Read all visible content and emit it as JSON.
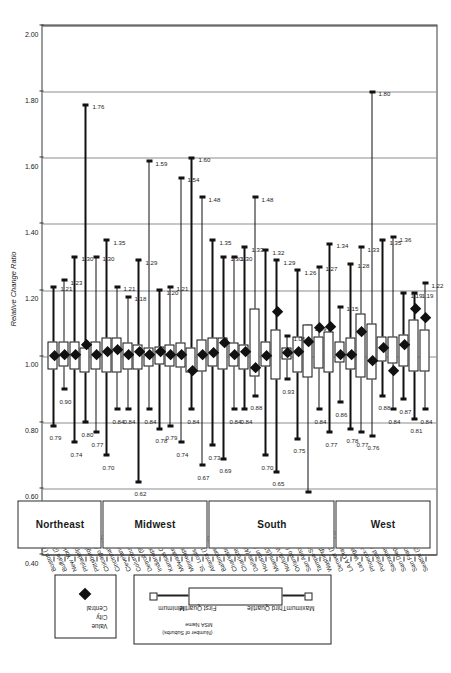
{
  "chart_data": {
    "type": "box",
    "title": "",
    "xlabel": "",
    "ylabel": "Relative Change Ratio",
    "ylim": [
      0.4,
      2.0
    ],
    "ytick_labels": [
      "2.00",
      "1.80",
      "1.60",
      "1.40",
      "1.20",
      "1.00",
      "0.80",
      "0.60",
      "0.40"
    ],
    "ytick_values": [
      2.0,
      1.8,
      1.6,
      1.4,
      1.2,
      1.0,
      0.8,
      0.6,
      0.4
    ],
    "grid": "vertical-at-ticks",
    "orientation": "horizontal-boxes-rotated-page",
    "regions": [
      {
        "name": "West",
        "start_index": 0,
        "end_index": 8
      },
      {
        "name": "South",
        "start_index": 9,
        "end_index": 20
      },
      {
        "name": "Midwest",
        "start_index": 21,
        "end_index": 30
      },
      {
        "name": "Northeast",
        "start_index": 31,
        "end_index": 38
      }
    ],
    "categories": [
      {
        "label": "Seattle (36)",
        "min": 0.84,
        "q1": 0.96,
        "q3": 1.08,
        "max": 1.22,
        "central": 1.115
      },
      {
        "label": "San Francisco (73)",
        "min": 0.81,
        "q1": 0.96,
        "q3": 1.11,
        "max": 1.19,
        "central": 1.145
      },
      {
        "label": "San Diego (34)",
        "min": 0.87,
        "q1": 0.975,
        "q3": 1.065,
        "max": 1.19,
        "central": 1.035
      },
      {
        "label": "Sacramento-Yolo (29)",
        "min": 0.84,
        "q1": 0.985,
        "q3": 1.06,
        "max": 1.36,
        "central": 0.955
      },
      {
        "label": "Portland (32)",
        "min": 0.88,
        "q1": 0.99,
        "q3": 1.06,
        "max": 1.35,
        "central": 1.025
      },
      {
        "label": "Phoenix-Mesa (38)",
        "min": 0.76,
        "q1": 0.935,
        "q3": 1.1,
        "max": 1.8,
        "central": 0.985
      },
      {
        "label": "Las Vegas (9)",
        "min": 0.77,
        "q1": 0.94,
        "q3": 1.13,
        "max": 1.33,
        "central": 1.075
      },
      {
        "label": "LA A Orange Co x (138)",
        "min": 0.78,
        "q1": 0.965,
        "q3": 1.055,
        "max": 1.28,
        "central": 1.005
      },
      {
        "label": "Denver (28)",
        "min": 0.86,
        "q1": 0.985,
        "q3": 1.045,
        "max": 1.15,
        "central": 1.005
      },
      {
        "label": "Washington, D.C. (136)",
        "min": 0.77,
        "q1": 0.955,
        "q3": 1.075,
        "max": 1.34,
        "central": 1.09
      },
      {
        "label": "Tampa-St. Petersburg (41)",
        "min": 0.84,
        "q1": 0.97,
        "q3": 1.06,
        "max": 1.27,
        "central": 1.085
      },
      {
        "label": "San Antonio (15)",
        "min": 0.59,
        "q1": 0.94,
        "q3": 1.095,
        "max": 1.09,
        "central": 1.045
      },
      {
        "label": "Orlando (22)",
        "min": 0.75,
        "q1": 0.955,
        "q3": 1.06,
        "max": 1.26,
        "central": 1.015
      },
      {
        "label": "Norfolk-Va Beach (19)",
        "min": 0.93,
        "q1": 0.995,
        "q3": 1.025,
        "max": 1.06,
        "central": 1.01
      },
      {
        "label": "Miami (52)",
        "min": 0.65,
        "q1": 0.935,
        "q3": 1.08,
        "max": 1.29,
        "central": 1.135
      },
      {
        "label": "Houston (43)",
        "min": 0.7,
        "q1": 0.975,
        "q3": 1.045,
        "max": 1.32,
        "central": 1.0
      },
      {
        "label": "Dallas (48)",
        "min": 0.88,
        "q1": 0.945,
        "q3": 1.145,
        "max": 1.48,
        "central": 0.965
      },
      {
        "label": "Charlotte NC (34)",
        "min": 0.84,
        "q1": 0.965,
        "q3": 1.035,
        "max": 1.33,
        "central": 1.015
      },
      {
        "label": "Charleston (28)",
        "min": 0.84,
        "q1": 0.975,
        "q3": 1.04,
        "max": 1.3,
        "central": 1.005
      },
      {
        "label": "Baltimore (88)",
        "min": 0.69,
        "q1": 0.965,
        "q3": 1.055,
        "max": 1.3,
        "central": 1.04
      },
      {
        "label": "Atlanta (106)",
        "min": 0.73,
        "q1": 0.975,
        "q3": 1.055,
        "max": 1.35,
        "central": 1.01
      },
      {
        "label": "St. Louis (98)",
        "min": 0.67,
        "q1": 0.96,
        "q3": 1.05,
        "max": 1.48,
        "central": 1.005
      },
      {
        "label": "Minneapolis-St. Paul (36)",
        "min": 0.84,
        "q1": 0.955,
        "q3": 1.025,
        "max": 1.6,
        "central": 0.955
      },
      {
        "label": "Milwaukee (40)",
        "min": 0.74,
        "q1": 0.97,
        "q3": 1.04,
        "max": 1.54,
        "central": 1.005
      },
      {
        "label": "Kansas City (26)",
        "min": 0.79,
        "q1": 0.975,
        "q3": 1.035,
        "max": 1.21,
        "central": 1.005
      },
      {
        "label": "Indianapolis (88)",
        "min": 0.78,
        "q1": 0.98,
        "q3": 1.03,
        "max": 1.2,
        "central": 1.015
      },
      {
        "label": "Detroit (99)",
        "min": 0.84,
        "q1": 0.975,
        "q3": 1.025,
        "max": 1.59,
        "central": 1.005
      },
      {
        "label": "Columbus OH (28)",
        "min": 0.62,
        "q1": 0.965,
        "q3": 1.035,
        "max": 1.29,
        "central": 1.015
      },
      {
        "label": "Cleveland (76)",
        "min": 0.84,
        "q1": 0.965,
        "q3": 1.04,
        "max": 1.18,
        "central": 1.005
      },
      {
        "label": "Cincinnati (67)",
        "min": 0.84,
        "q1": 0.955,
        "q3": 1.055,
        "max": 1.21,
        "central": 1.02
      },
      {
        "label": "Chicago (213)",
        "min": 0.7,
        "q1": 0.955,
        "q3": 1.055,
        "max": 1.35,
        "central": 1.015
      },
      {
        "label": "Pittsburgh (128)",
        "min": 0.77,
        "q1": 0.965,
        "q3": 1.045,
        "max": 1.3,
        "central": 1.005
      },
      {
        "label": "Philadelphia (139)",
        "min": 0.8,
        "q1": 0.955,
        "q3": 1.025,
        "max": 1.76,
        "central": 1.035
      },
      {
        "label": "New York (618)",
        "min": 0.74,
        "q1": 0.965,
        "q3": 1.045,
        "max": 1.3,
        "central": 1.005
      },
      {
        "label": "Buffalo (26)",
        "min": 0.9,
        "q1": 0.975,
        "q3": 1.045,
        "max": 1.23,
        "central": 1.005
      },
      {
        "label": "Boston (76)",
        "min": 0.79,
        "q1": 0.965,
        "q3": 1.045,
        "max": 1.21,
        "central": 1.0
      }
    ],
    "max_annotations": [
      "1.22",
      "1.19",
      "1.19",
      "1.36",
      "1.35",
      "1.80",
      "1.33",
      "1.28",
      "1.15",
      "1.34",
      "1.27",
      "1.09",
      "1.26",
      "1.06",
      "1.29",
      "1.32",
      "1.48",
      "1.33",
      "1.30",
      "1.35",
      "1.48",
      "1.60",
      "1.54",
      "1.21",
      "1.20",
      "1.59",
      "1.29",
      "1.18",
      "1.21",
      "1.35",
      "1.30",
      "1.76",
      "1.23",
      "1.21"
    ],
    "min_annotations": [
      "0.84",
      "0.81",
      "0.87",
      "0.84",
      "0.88",
      "0.76",
      "0.77",
      "0.78",
      "0.86",
      "0.77",
      "0.84",
      "0.59",
      "0.75",
      "0.93",
      "0.65",
      "0.70",
      "0.88",
      "0.84",
      "0.84",
      "0.69",
      "0.73",
      "0.67",
      "0.84",
      "0.74",
      "0.79",
      "0.78",
      "0.62",
      "0.84",
      "0.70",
      "0.73",
      "0.77",
      "0.80",
      "0.74",
      "0.90",
      "0.79"
    ]
  },
  "legend": {
    "main_items": [
      "Maximum",
      "Third Quartile",
      "First Quartile",
      "Minimum"
    ],
    "msa_line1": "MSA Name",
    "msa_line2": "(Number of Suburbs)",
    "central_lines": [
      "Central",
      "City",
      "Value"
    ]
  },
  "axis": {
    "title": "Relative Change Ratio",
    "ticks": [
      "2.00",
      "1.80",
      "1.60",
      "1.40",
      "1.20",
      "1.00",
      "0.80",
      "0.60",
      "0.40"
    ]
  },
  "colors": {
    "ink": "#111111",
    "grid": "#8d8d8d",
    "frame": "#3a3a3a",
    "box_fill": "#ffffff"
  }
}
